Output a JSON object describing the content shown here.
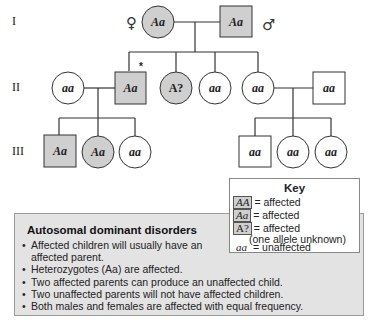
{
  "generations": {
    "labels": [
      "I",
      "II",
      "III"
    ]
  },
  "symbols": {
    "female": "♀",
    "male": "♂",
    "proband_marker": "*"
  },
  "pedigree": {
    "gen1": {
      "mother": {
        "genotype": "Aa",
        "sex": "female",
        "affected": true
      },
      "father": {
        "genotype": "Aa",
        "sex": "male",
        "affected": true
      }
    },
    "gen2": [
      {
        "genotype": "aa",
        "sex": "female",
        "affected": false,
        "note": "spouse"
      },
      {
        "genotype": "Aa",
        "sex": "male",
        "affected": true,
        "proband": true
      },
      {
        "genotype": "A?",
        "sex": "female",
        "affected": true
      },
      {
        "genotype": "aa",
        "sex": "female",
        "affected": false
      },
      {
        "genotype": "aa",
        "sex": "female",
        "affected": false
      },
      {
        "genotype": "aa",
        "sex": "male",
        "affected": false,
        "note": "spouse"
      }
    ],
    "gen3_left": [
      {
        "genotype": "Aa",
        "sex": "male",
        "affected": true
      },
      {
        "genotype": "Aa",
        "sex": "female",
        "affected": true
      },
      {
        "genotype": "aa",
        "sex": "female",
        "affected": false
      }
    ],
    "gen3_right": [
      {
        "genotype": "aa",
        "sex": "male",
        "affected": false
      },
      {
        "genotype": "aa",
        "sex": "female",
        "affected": false
      },
      {
        "genotype": "aa",
        "sex": "female",
        "affected": false
      }
    ]
  },
  "key": {
    "title": "Key",
    "rows": [
      {
        "symbol": "AA",
        "text": "= affected"
      },
      {
        "symbol": "Aa",
        "text": "= affected"
      },
      {
        "symbol": "A?",
        "text": "= affected"
      },
      {
        "symbol": "aa",
        "text": "= unaffected"
      }
    ],
    "note": "(one allele unknown)"
  },
  "info": {
    "title": "Autosomal dominant disorders",
    "bullets": [
      "Affected children will usually have an affected parent.",
      "Heterozygotes (Aa) are affected.",
      "Two affected parents can produce an unaffected child.",
      "Two unaffected parents will not have affected children.",
      "Both males and females are affected with equal frequency."
    ]
  },
  "colors": {
    "affected_fill": "#cfcfcf",
    "unaffected_fill": "#ffffff",
    "line": "#333333",
    "info_bg": "#e3e3e3"
  }
}
